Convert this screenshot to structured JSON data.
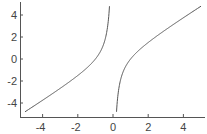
{
  "chart_data": {
    "type": "line",
    "title": "",
    "xlabel": "",
    "ylabel": "",
    "function": "y = x - 1/x",
    "xlim": [
      -5.2,
      5.2
    ],
    "ylim": [
      -5.2,
      5.2
    ],
    "x_ticks": [
      -4,
      -2,
      0,
      2,
      4
    ],
    "y_ticks": [
      4,
      2,
      0,
      -2,
      -4
    ],
    "x_tick_labels": [
      "-4",
      "-2",
      "0",
      "2",
      "4"
    ],
    "y_tick_labels": [
      "4",
      "2",
      "0",
      "-2",
      "-4"
    ],
    "grid": false,
    "legend": null,
    "series": [
      {
        "name": "left branch",
        "x": [
          -5,
          -4,
          -3,
          -2,
          -1.5,
          -1,
          -0.7,
          -0.5,
          -0.35,
          -0.25,
          -0.2
        ],
        "y": [
          -4.8,
          -3.75,
          -2.67,
          -1.5,
          -0.83,
          0,
          0.73,
          1.5,
          2.51,
          3.75,
          4.8
        ]
      },
      {
        "name": "right branch",
        "x": [
          0.2,
          0.25,
          0.35,
          0.5,
          0.7,
          1,
          1.5,
          2,
          3,
          4,
          5
        ],
        "y": [
          -4.8,
          -3.75,
          -2.51,
          -1.5,
          -0.73,
          0,
          0.83,
          1.5,
          2.67,
          3.75,
          4.8
        ]
      }
    ],
    "colors": {
      "line": "#555555",
      "axis": "#555555",
      "text": "#444444"
    }
  }
}
